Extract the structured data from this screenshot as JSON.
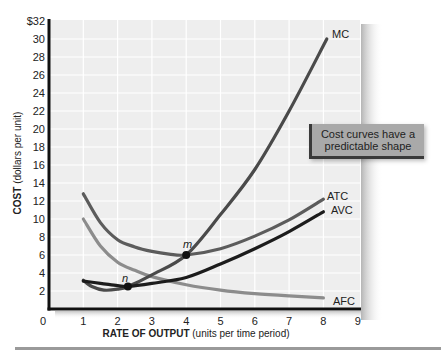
{
  "chart_data": {
    "type": "line",
    "title": "",
    "xlabel": "RATE OF OUTPUT (units per time period)",
    "xlabel_bold": "RATE OF OUTPUT",
    "xlabel_rest": " (units per time period)",
    "ylabel": "COST (dollars per unit)",
    "ylabel_bold": "COST",
    "ylabel_rest": " (dollars per unit)",
    "xlim": [
      0,
      9
    ],
    "ylim": [
      0,
      32
    ],
    "grid": true,
    "legend": "none (curves labeled at right end)",
    "x_ticks": [
      "0",
      "1",
      "2",
      "3",
      "4",
      "5",
      "6",
      "7",
      "8",
      "9"
    ],
    "y_ticks": [
      {
        "value": 32,
        "label": "$32"
      },
      {
        "value": 30,
        "label": "30"
      },
      {
        "value": 28,
        "label": "28"
      },
      {
        "value": 26,
        "label": "26"
      },
      {
        "value": 24,
        "label": "24"
      },
      {
        "value": 22,
        "label": "22"
      },
      {
        "value": 20,
        "label": "20"
      },
      {
        "value": 18,
        "label": "18"
      },
      {
        "value": 16,
        "label": "16"
      },
      {
        "value": 14,
        "label": "14"
      },
      {
        "value": 12,
        "label": "12"
      },
      {
        "value": 10,
        "label": "10"
      },
      {
        "value": 8,
        "label": "8"
      },
      {
        "value": 6,
        "label": "6"
      },
      {
        "value": 4,
        "label": "4"
      },
      {
        "value": 2,
        "label": "2"
      }
    ],
    "series": [
      {
        "name": "MC",
        "color": "#4a4a4a",
        "points": [
          [
            1,
            3.2
          ],
          [
            1.25,
            2.5
          ],
          [
            1.6,
            2.1
          ],
          [
            2,
            2.2
          ],
          [
            2.3,
            2.5
          ],
          [
            3,
            3.8
          ],
          [
            4,
            6.0
          ],
          [
            5,
            10.5
          ],
          [
            6,
            15.5
          ],
          [
            7,
            22.0
          ],
          [
            8.1,
            30.0
          ]
        ]
      },
      {
        "name": "ATC",
        "color": "#5c5c5c",
        "points": [
          [
            1,
            12.8
          ],
          [
            1.5,
            9.6
          ],
          [
            2,
            7.7
          ],
          [
            2.5,
            6.9
          ],
          [
            3,
            6.4
          ],
          [
            3.5,
            6.1
          ],
          [
            4,
            6.0
          ],
          [
            5,
            6.7
          ],
          [
            6,
            8.1
          ],
          [
            7,
            9.9
          ],
          [
            8,
            12.2
          ]
        ]
      },
      {
        "name": "AVC",
        "color": "#1c1c1c",
        "points": [
          [
            1,
            3.1
          ],
          [
            1.5,
            2.85
          ],
          [
            2,
            2.6
          ],
          [
            2.3,
            2.5
          ],
          [
            3,
            2.85
          ],
          [
            4,
            3.5
          ],
          [
            5,
            5.0
          ],
          [
            6,
            6.7
          ],
          [
            7,
            8.6
          ],
          [
            8,
            10.8
          ]
        ]
      },
      {
        "name": "AFC",
        "color": "#8c8c8c",
        "points": [
          [
            1,
            10.0
          ],
          [
            1.5,
            7.0
          ],
          [
            2,
            5.2
          ],
          [
            2.5,
            4.3
          ],
          [
            3,
            3.6
          ],
          [
            4,
            2.7
          ],
          [
            5,
            2.1
          ],
          [
            6,
            1.7
          ],
          [
            7,
            1.45
          ],
          [
            8,
            1.25
          ]
        ]
      }
    ],
    "annotations": [
      {
        "label": "m",
        "x": 4.0,
        "y": 6.0,
        "note": "MC intersects ATC at its minimum"
      },
      {
        "label": "n",
        "x": 2.3,
        "y": 2.5,
        "note": "MC intersects AVC at its minimum"
      }
    ],
    "callout": {
      "line1": "Cost curves have a",
      "line2": "predictable shape"
    }
  }
}
